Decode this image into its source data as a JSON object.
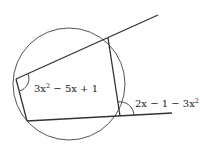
{
  "diagram": {
    "type": "cyclic-quadrilateral",
    "labels": {
      "interior_angle": {
        "base": "3x",
        "sup": "2",
        "rest": " − 5x + 1"
      },
      "exterior_angle": {
        "base": "2x − 1 − 3x",
        "sup": "2"
      }
    },
    "colors": {
      "stroke": "#333333",
      "circle": "#555555",
      "text": "#222222"
    }
  }
}
